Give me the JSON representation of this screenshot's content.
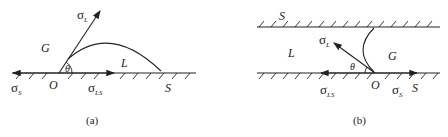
{
  "figure": {
    "panels": [
      {
        "id": "a",
        "caption": "(a)",
        "labels": {
          "sigma_L": "σ",
          "sigma_L_sub": "L",
          "sigma_S": "σ",
          "sigma_S_sub": "S",
          "sigma_LS": "σ",
          "sigma_LS_sub": "LS",
          "gas": "G",
          "liquid": "L",
          "solid": "S",
          "origin": "O",
          "angle": "θ"
        }
      },
      {
        "id": "b",
        "caption": "(b)",
        "labels": {
          "sigma_L": "σ",
          "sigma_L_sub": "L",
          "sigma_S": "σ",
          "sigma_S_sub": "S",
          "sigma_LS": "σ",
          "sigma_LS_sub": "LS",
          "gas": "G",
          "liquid": "L",
          "solid_top": "S",
          "solid_bottom": "S",
          "origin": "O",
          "angle": "θ"
        }
      }
    ],
    "colors": {
      "ink": "#222222",
      "background": "#ffffff"
    }
  }
}
